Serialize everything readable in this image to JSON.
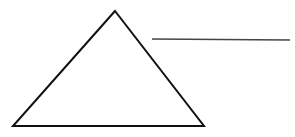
{
  "diagram": {
    "background": "#ffffff",
    "stroke_color": "#111111",
    "triangle": {
      "apex": [
        115,
        11
      ],
      "base_left": [
        13,
        126
      ],
      "base_right": [
        204,
        126
      ],
      "stroke_width": 2
    },
    "line": {
      "start": [
        152,
        39
      ],
      "end": [
        290,
        40
      ],
      "color": "#444444",
      "stroke_width": 1.3
    }
  }
}
